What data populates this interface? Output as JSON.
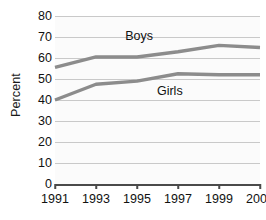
{
  "chart_data": {
    "type": "line",
    "title": "",
    "xlabel": "",
    "ylabel": "Percent",
    "categories": [
      "1991",
      "1993",
      "1995",
      "1997",
      "1999",
      "2001"
    ],
    "x": [
      1991,
      1993,
      1995,
      1997,
      1999,
      2001
    ],
    "xlim": [
      1991,
      2001
    ],
    "ylim": [
      0,
      80
    ],
    "ytick_labels": [
      "0",
      "10",
      "20",
      "30",
      "40",
      "50",
      "60",
      "70",
      "80"
    ],
    "yticks": [
      0,
      10,
      20,
      30,
      40,
      50,
      60,
      70,
      80
    ],
    "grid": true,
    "legend": "inline-labels",
    "series": [
      {
        "name": "Boys",
        "values": [
          55.5,
          60.5,
          60.5,
          63.0,
          66.0,
          65.0
        ],
        "color": "#8c8c8c",
        "label_x": 1995.1,
        "label_y": 70.5
      },
      {
        "name": "Girls",
        "values": [
          40.0,
          47.5,
          49.0,
          52.5,
          52.0,
          52.0
        ],
        "color": "#8c8c8c",
        "label_x": 1996.6,
        "label_y": 44.5
      }
    ]
  },
  "colors": {
    "series_line": "#8c8c8c",
    "gridline": "#c9c9c9",
    "axis": "#4a4a4a",
    "text": "#111111",
    "plot_background": "#fbfbfb",
    "page_background": "#ffffff"
  }
}
